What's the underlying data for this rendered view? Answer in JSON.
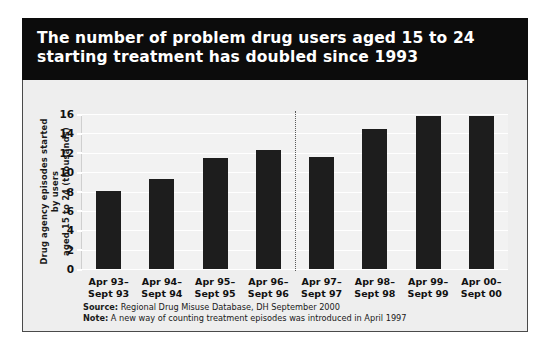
{
  "title": "The number of problem drug users aged 15 to 24 starting treatment has doubled since 1993",
  "footnotes": {
    "source_key": "Source:",
    "source_text": " Regional Drug Misuse Database, DH September 2000",
    "note_key": "Note:",
    "note_text": " A new way of counting treatment episodes was introduced in April 1997"
  },
  "colors": {
    "title_band": "#0c0c0c",
    "title_text": "#ffffff",
    "bar": "#1d1d1d",
    "panel_bg": "#eeeeee",
    "plot_bg": "#f2f2f2",
    "gridline": "#ffffff",
    "divider": "#5a5a5a"
  },
  "chart_data": {
    "type": "bar",
    "title": "The number of problem drug users aged 15 to 24 starting treatment has doubled since 1993",
    "xlabel": "",
    "ylabel": "Drug agency episodes started by users aged 15 to 24 (thousands)",
    "ylabel_lines": [
      "Drug agency episodes started by users",
      "aged 15 to 24 (thousands)"
    ],
    "categories": [
      "Apr 93–\nSept 93",
      "Apr 94–\nSept 94",
      "Apr 95–\nSept 95",
      "Apr 96–\nSept 96",
      "Apr 97–\nSept 97",
      "Apr 98–\nSept 98",
      "Apr 99–\nSept 99",
      "Apr 00–\nSept 00"
    ],
    "category_lines": [
      [
        "Apr 93–",
        "Sept 93"
      ],
      [
        "Apr 94–",
        "Sept 94"
      ],
      [
        "Apr 95–",
        "Sept 95"
      ],
      [
        "Apr 96–",
        "Sept 96"
      ],
      [
        "Apr 97–",
        "Sept 97"
      ],
      [
        "Apr 98–",
        "Sept 98"
      ],
      [
        "Apr 99–",
        "Sept 99"
      ],
      [
        "Apr 00–",
        "Sept 00"
      ]
    ],
    "values": [
      8.1,
      9.3,
      11.5,
      12.3,
      11.6,
      14.5,
      15.8,
      15.8
    ],
    "ylim": [
      0,
      16
    ],
    "yticks": [
      0,
      2,
      4,
      6,
      8,
      10,
      12,
      14,
      16
    ],
    "ytick_labels": [
      "0",
      "2",
      "4",
      "6",
      "8",
      "10",
      "12",
      "14",
      "16"
    ],
    "grid": true,
    "legend": "none",
    "annotations": [
      {
        "type": "vertical-dotted-divider",
        "after_category_index": 3,
        "meaning": "A new way of counting treatment episodes was introduced in April 1997"
      }
    ]
  }
}
